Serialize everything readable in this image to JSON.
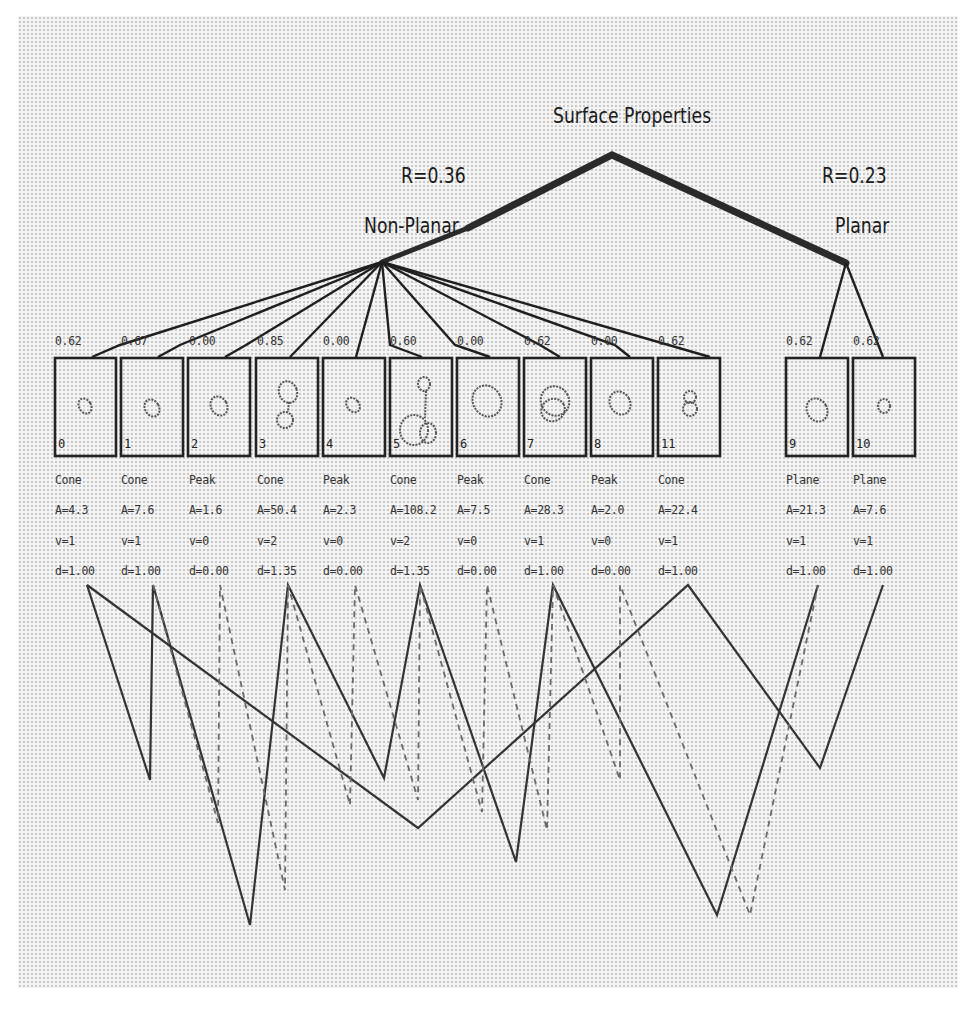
{
  "root": {
    "label": "Surface Properties"
  },
  "groups": [
    {
      "id": "non_planar",
      "label": "Non-Planar",
      "r_label": "R=0.36"
    },
    {
      "id": "planar",
      "label": "Planar",
      "r_label": "R=0.23"
    }
  ],
  "segments": [
    {
      "id": "0",
      "group": "non_planar",
      "score": "0.62",
      "type": "Cone",
      "A": "A=4.3",
      "v": "v=1",
      "d": "d=1.00"
    },
    {
      "id": "1",
      "group": "non_planar",
      "score": "0.67",
      "type": "Cone",
      "A": "A=7.6",
      "v": "v=1",
      "d": "d=1.00"
    },
    {
      "id": "2",
      "group": "non_planar",
      "score": "0.00",
      "type": "Peak",
      "A": "A=1.6",
      "v": "v=0",
      "d": "d=0.00"
    },
    {
      "id": "3",
      "group": "non_planar",
      "score": "0.85",
      "type": "Cone",
      "A": "A=50.4",
      "v": "v=2",
      "d": "d=1.35"
    },
    {
      "id": "4",
      "group": "non_planar",
      "score": "0.00",
      "type": "Peak",
      "A": "A=2.3",
      "v": "v=0",
      "d": "d=0.00"
    },
    {
      "id": "5",
      "group": "non_planar",
      "score": "0.60",
      "type": "Cone",
      "A": "A=108.2",
      "v": "v=2",
      "d": "d=1.35"
    },
    {
      "id": "6",
      "group": "non_planar",
      "score": "0.00",
      "type": "Peak",
      "A": "A=7.5",
      "v": "v=0",
      "d": "d=0.00"
    },
    {
      "id": "7",
      "group": "non_planar",
      "score": "0.62",
      "type": "Cone",
      "A": "A=28.3",
      "v": "v=1",
      "d": "d=1.00"
    },
    {
      "id": "8",
      "group": "non_planar",
      "score": "0.00",
      "type": "Peak",
      "A": "A=2.0",
      "v": "v=0",
      "d": "d=0.00"
    },
    {
      "id": "11",
      "group": "non_planar",
      "score": "0.62",
      "type": "Cone",
      "A": "A=22.4",
      "v": "v=1",
      "d": "d=1.00"
    },
    {
      "id": "9",
      "group": "planar",
      "score": "0.62",
      "type": "Plane",
      "A": "A=21.3",
      "v": "v=1",
      "d": "d=1.00"
    },
    {
      "id": "10",
      "group": "planar",
      "score": "0.62",
      "type": "Plane",
      "A": "A=7.6",
      "v": "v=1",
      "d": "d=1.00"
    }
  ],
  "colors": {
    "ink": "#1a1a1a",
    "dashed": "#777777",
    "background_dots": "#c8c8c8"
  }
}
